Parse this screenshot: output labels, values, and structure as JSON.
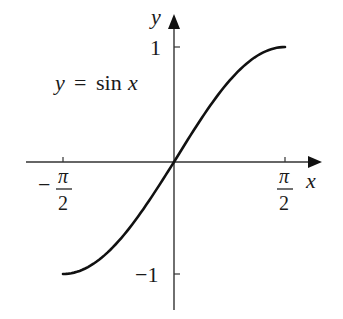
{
  "chart_data": {
    "type": "line",
    "title": "",
    "annotation": "y = sin x",
    "xlabel": "x",
    "ylabel": "y",
    "x_ticks": [
      "-π/2",
      "π/2"
    ],
    "y_ticks": [
      "1",
      "-1"
    ],
    "xlim": [
      -1.5708,
      1.5708
    ],
    "ylim": [
      -1,
      1
    ],
    "grid": false,
    "legend": "none",
    "series": [
      {
        "name": "y = sin x",
        "x": [
          -1.5708,
          -1.1781,
          -0.7854,
          -0.3927,
          0,
          0.3927,
          0.7854,
          1.1781,
          1.5708
        ],
        "y": [
          -1,
          -0.9239,
          -0.7071,
          -0.3827,
          0,
          0.3827,
          0.7071,
          0.9239,
          1
        ]
      }
    ]
  },
  "labels": {
    "y_axis": "y",
    "x_axis": "x",
    "y_tick_pos": "1",
    "y_tick_neg": "−1",
    "x_tick_neg_sign": "−",
    "pi": "π",
    "two": "2",
    "eq_y": "y",
    "eq_eq": "=",
    "eq_sin": "sin",
    "eq_x": "x"
  },
  "colors": {
    "ink": "#1a1a1a",
    "background": "#ffffff"
  }
}
